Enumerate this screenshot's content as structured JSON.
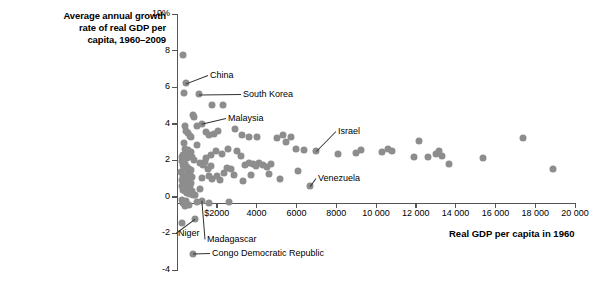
{
  "chart_data": {
    "type": "scatter",
    "title": "Average annual growth rate of real GDP per capita, 1960–2009",
    "title_lines": [
      "Average annual growth",
      "rate of real GDP per",
      "capita, 1960–2009"
    ],
    "xlabel": "Real GDP per capita in 1960",
    "ylabel": "Average annual growth rate of real GDP per capita, 1960–2009",
    "xlim": [
      0,
      20000
    ],
    "ylim": [
      -4,
      10
    ],
    "grid": false,
    "legend": null,
    "point_color": "#8d8d8d",
    "axis_color": "#555555",
    "xticks": [
      {
        "value": 2000,
        "label": "$2000"
      },
      {
        "value": 4000,
        "label": "4000"
      },
      {
        "value": 6000,
        "label": "6000"
      },
      {
        "value": 8000,
        "label": "8000"
      },
      {
        "value": 10000,
        "label": "10 000"
      },
      {
        "value": 12000,
        "label": "12 000"
      },
      {
        "value": 14000,
        "label": "14 000"
      },
      {
        "value": 16000,
        "label": "16 000"
      },
      {
        "value": 18000,
        "label": "18 000"
      },
      {
        "value": 20000,
        "label": "20 000"
      }
    ],
    "yticks": [
      {
        "value": 10,
        "label": "10%"
      },
      {
        "value": 8,
        "label": "8"
      },
      {
        "value": 6,
        "label": "6"
      },
      {
        "value": 4,
        "label": "4"
      },
      {
        "value": 2,
        "label": "2"
      },
      {
        "value": 0,
        "label": "0"
      },
      {
        "value": -2,
        "label": "-2"
      },
      {
        "value": -4,
        "label": "-4"
      }
    ],
    "annotations": [
      {
        "name": "China",
        "label": "China",
        "x": 450,
        "y": 6.2,
        "label_x": 210,
        "label_y": 70
      },
      {
        "name": "South Korea",
        "label": "South Korea",
        "x": 1100,
        "y": 5.6,
        "label_x": 243,
        "label_y": 89
      },
      {
        "name": "Malaysia",
        "label": "Malaysia",
        "x": 1250,
        "y": 4.0,
        "label_x": 228,
        "label_y": 113
      },
      {
        "name": "Israel",
        "label": "Israel",
        "x": 7000,
        "y": 2.5,
        "label_x": 338,
        "label_y": 126
      },
      {
        "name": "Venezuela",
        "label": "Venezuela",
        "x": 6700,
        "y": 0.6,
        "label_x": 318,
        "label_y": 173
      },
      {
        "name": "Niger",
        "label": "Niger",
        "x": 900,
        "y": -1.2,
        "label_x": 178,
        "label_y": 228
      },
      {
        "name": "Madagascar",
        "label": "Madagascar",
        "x": 1250,
        "y": -0.2,
        "label_x": 207,
        "label_y": 234
      },
      {
        "name": "Congo Democratic Republic",
        "label": "Congo Democratic Republic",
        "x": 780,
        "y": -3.1,
        "label_x": 212,
        "label_y": 248
      }
    ],
    "points": [
      {
        "x": 290,
        "y": 7.75
      },
      {
        "x": 450,
        "y": 6.2
      },
      {
        "x": 330,
        "y": 5.7
      },
      {
        "x": 1100,
        "y": 5.6
      },
      {
        "x": 1750,
        "y": 5.0
      },
      {
        "x": 2300,
        "y": 5.0
      },
      {
        "x": 780,
        "y": 4.5
      },
      {
        "x": 860,
        "y": 4.35
      },
      {
        "x": 1250,
        "y": 4.0
      },
      {
        "x": 1000,
        "y": 3.85
      },
      {
        "x": 420,
        "y": 3.85
      },
      {
        "x": 470,
        "y": 3.6
      },
      {
        "x": 560,
        "y": 3.5
      },
      {
        "x": 640,
        "y": 3.35
      },
      {
        "x": 720,
        "y": 3.3
      },
      {
        "x": 1450,
        "y": 3.55
      },
      {
        "x": 1600,
        "y": 3.4
      },
      {
        "x": 1850,
        "y": 3.45
      },
      {
        "x": 2050,
        "y": 3.6
      },
      {
        "x": 2900,
        "y": 3.7
      },
      {
        "x": 3250,
        "y": 3.4
      },
      {
        "x": 3600,
        "y": 3.25
      },
      {
        "x": 4000,
        "y": 3.3
      },
      {
        "x": 5000,
        "y": 3.2
      },
      {
        "x": 5350,
        "y": 3.4
      },
      {
        "x": 5500,
        "y": 3.0
      },
      {
        "x": 5750,
        "y": 3.3
      },
      {
        "x": 7000,
        "y": 2.5
      },
      {
        "x": 6000,
        "y": 2.6
      },
      {
        "x": 6400,
        "y": 2.55
      },
      {
        "x": 8100,
        "y": 2.35
      },
      {
        "x": 9000,
        "y": 2.4
      },
      {
        "x": 9250,
        "y": 2.55
      },
      {
        "x": 10300,
        "y": 2.45
      },
      {
        "x": 10600,
        "y": 2.6
      },
      {
        "x": 10800,
        "y": 2.5
      },
      {
        "x": 12600,
        "y": 2.2
      },
      {
        "x": 13000,
        "y": 2.35
      },
      {
        "x": 13150,
        "y": 2.5
      },
      {
        "x": 13300,
        "y": 2.25
      },
      {
        "x": 12150,
        "y": 3.05
      },
      {
        "x": 11900,
        "y": 2.2
      },
      {
        "x": 13650,
        "y": 1.8
      },
      {
        "x": 15400,
        "y": 2.1
      },
      {
        "x": 17400,
        "y": 3.2
      },
      {
        "x": 18900,
        "y": 1.55
      },
      {
        "x": 330,
        "y": 2.95
      },
      {
        "x": 380,
        "y": 2.6
      },
      {
        "x": 300,
        "y": 2.3
      },
      {
        "x": 430,
        "y": 2.45
      },
      {
        "x": 480,
        "y": 2.15
      },
      {
        "x": 560,
        "y": 2.55
      },
      {
        "x": 610,
        "y": 2.3
      },
      {
        "x": 690,
        "y": 2.45
      },
      {
        "x": 760,
        "y": 2.2
      },
      {
        "x": 840,
        "y": 2.0
      },
      {
        "x": 260,
        "y": 1.95
      },
      {
        "x": 320,
        "y": 1.75
      },
      {
        "x": 370,
        "y": 1.6
      },
      {
        "x": 420,
        "y": 1.8
      },
      {
        "x": 470,
        "y": 1.5
      },
      {
        "x": 520,
        "y": 1.65
      },
      {
        "x": 560,
        "y": 1.3
      },
      {
        "x": 600,
        "y": 1.55
      },
      {
        "x": 650,
        "y": 1.2
      },
      {
        "x": 700,
        "y": 1.45
      },
      {
        "x": 740,
        "y": 1.1
      },
      {
        "x": 300,
        "y": 1.15
      },
      {
        "x": 350,
        "y": 0.95
      },
      {
        "x": 400,
        "y": 1.05
      },
      {
        "x": 450,
        "y": 0.85
      },
      {
        "x": 500,
        "y": 0.95
      },
      {
        "x": 550,
        "y": 0.7
      },
      {
        "x": 600,
        "y": 0.85
      },
      {
        "x": 650,
        "y": 0.6
      },
      {
        "x": 700,
        "y": 0.75
      },
      {
        "x": 250,
        "y": 0.6
      },
      {
        "x": 290,
        "y": 0.4
      },
      {
        "x": 340,
        "y": 0.5
      },
      {
        "x": 390,
        "y": 0.3
      },
      {
        "x": 440,
        "y": 0.45
      },
      {
        "x": 500,
        "y": 0.2
      },
      {
        "x": 570,
        "y": 0.35
      },
      {
        "x": 640,
        "y": 0.15
      },
      {
        "x": 730,
        "y": 0.3
      },
      {
        "x": 820,
        "y": 0.1
      },
      {
        "x": 210,
        "y": 1.35
      },
      {
        "x": 230,
        "y": 0.9
      },
      {
        "x": 245,
        "y": 2.2
      },
      {
        "x": 1000,
        "y": 2.85
      },
      {
        "x": 1150,
        "y": 1.85
      },
      {
        "x": 1300,
        "y": 1.75
      },
      {
        "x": 1420,
        "y": 1.9
      },
      {
        "x": 1550,
        "y": 1.55
      },
      {
        "x": 1700,
        "y": 1.7
      },
      {
        "x": 1280,
        "y": 1.05
      },
      {
        "x": 1600,
        "y": 1.15
      },
      {
        "x": 1780,
        "y": 0.95
      },
      {
        "x": 2000,
        "y": 1.15
      },
      {
        "x": 2150,
        "y": 0.9
      },
      {
        "x": 2350,
        "y": 1.3
      },
      {
        "x": 2500,
        "y": 1.6
      },
      {
        "x": 2700,
        "y": 1.5
      },
      {
        "x": 2850,
        "y": 1.2
      },
      {
        "x": 3000,
        "y": 2.5
      },
      {
        "x": 3200,
        "y": 2.25
      },
      {
        "x": 2550,
        "y": 2.6
      },
      {
        "x": 2250,
        "y": 2.35
      },
      {
        "x": 1950,
        "y": 2.5
      },
      {
        "x": 1700,
        "y": 2.3
      },
      {
        "x": 1450,
        "y": 2.15
      },
      {
        "x": 3400,
        "y": 1.75
      },
      {
        "x": 3600,
        "y": 1.85
      },
      {
        "x": 3800,
        "y": 1.8
      },
      {
        "x": 3950,
        "y": 1.7
      },
      {
        "x": 4100,
        "y": 1.85
      },
      {
        "x": 4300,
        "y": 1.75
      },
      {
        "x": 4500,
        "y": 1.65
      },
      {
        "x": 4700,
        "y": 1.8
      },
      {
        "x": 3300,
        "y": 0.85
      },
      {
        "x": 3700,
        "y": 1.2
      },
      {
        "x": 4600,
        "y": 1.25
      },
      {
        "x": 5200,
        "y": 0.95
      },
      {
        "x": 6100,
        "y": 1.4
      },
      {
        "x": 6700,
        "y": 0.6
      },
      {
        "x": 900,
        "y": -1.2
      },
      {
        "x": 1250,
        "y": -0.2
      },
      {
        "x": 780,
        "y": -3.1
      },
      {
        "x": 310,
        "y": -0.35
      },
      {
        "x": 380,
        "y": -0.5
      },
      {
        "x": 470,
        "y": -0.25
      },
      {
        "x": 600,
        "y": -0.45
      },
      {
        "x": 1000,
        "y": -0.3
      },
      {
        "x": 1600,
        "y": -0.35
      },
      {
        "x": 2600,
        "y": -0.3
      },
      {
        "x": 240,
        "y": -1.45
      },
      {
        "x": 260,
        "y": -0.15
      },
      {
        "x": 880,
        "y": 0.1
      },
      {
        "x": 1150,
        "y": 0.45
      }
    ]
  }
}
